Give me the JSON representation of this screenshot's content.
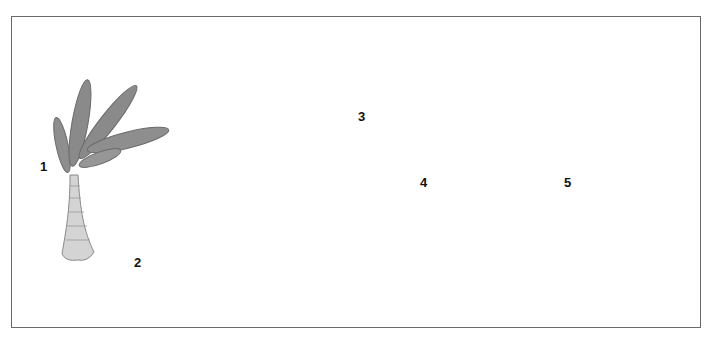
{
  "plate": {
    "specimens": [
      {
        "number": "1",
        "subject": "seed fern frond"
      },
      {
        "number": "2",
        "subject": "sail-backed reptile"
      },
      {
        "number": "3",
        "subject": "mammal-like reptile"
      },
      {
        "number": "4",
        "subject": "brachiopod shell"
      },
      {
        "number": "5",
        "subject": "coiled gastropod shell"
      }
    ]
  },
  "colors": {
    "frame": "#6a6a6a",
    "ink": "#111111",
    "body_grey": "#8a8a8a",
    "dark_grey": "#4a4a4a",
    "light_grey": "#c8c8c8"
  }
}
